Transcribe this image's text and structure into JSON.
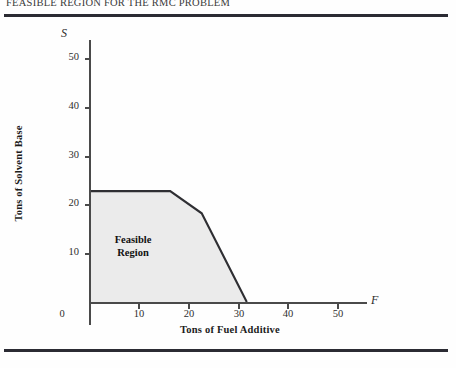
{
  "figure": {
    "title": "FEASIBLE REGION FOR THE RMC PROBLEM",
    "region_label_line1": "Feasible",
    "region_label_line2": "Region",
    "x_axis_name": "F",
    "y_axis_name": "S",
    "shade_color": "#ebebeb",
    "line_color": "#2f2f33",
    "axis_color": "#4a4a4a",
    "rule_color": "#2b2b33"
  },
  "chart_data": {
    "type": "area",
    "title": "FEASIBLE REGION FOR THE RMC PROBLEM",
    "xlabel": "Tons of Fuel Additive",
    "ylabel": "Tons of Solvent Base",
    "x_axis_symbol": "F",
    "y_axis_symbol": "S",
    "xlim": [
      0,
      55
    ],
    "ylim": [
      0,
      55
    ],
    "xticks": [
      0,
      10,
      20,
      30,
      40,
      50
    ],
    "yticks": [
      0,
      10,
      20,
      30,
      40,
      50
    ],
    "xtick_labels": [
      "0",
      "10",
      "20",
      "30",
      "40",
      "50"
    ],
    "ytick_labels": [
      "0",
      "10",
      "20",
      "30",
      "40",
      "50"
    ],
    "grid": false,
    "legend": false,
    "annotations": [
      {
        "text": "Feasible Region",
        "x": 12,
        "y": 13
      }
    ],
    "series": [
      {
        "name": "Feasible Region",
        "type": "polygon",
        "fill": "#ebebeb",
        "stroke": "#2f2f33",
        "vertices": [
          {
            "x": 0,
            "y": 0
          },
          {
            "x": 0,
            "y": 25
          },
          {
            "x": 18,
            "y": 25
          },
          {
            "x": 25,
            "y": 20
          },
          {
            "x": 35,
            "y": 0
          }
        ]
      }
    ]
  },
  "axis": {
    "x_tick_values": [
      "0",
      "10",
      "20",
      "30",
      "40",
      "50"
    ],
    "y_tick_values": [
      "10",
      "20",
      "30",
      "40",
      "50"
    ],
    "origin_value": "0",
    "x_title": "Tons of Fuel Additive",
    "y_title": "Tons of Solvent Base"
  }
}
